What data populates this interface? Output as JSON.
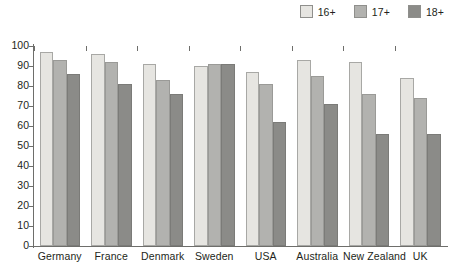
{
  "chart_data": {
    "type": "bar",
    "title": "",
    "subtitle": "",
    "xlabel": "",
    "ylabel": "",
    "ylim": [
      0,
      100
    ],
    "yticks": [
      0,
      10,
      20,
      30,
      40,
      50,
      60,
      70,
      80,
      90,
      100
    ],
    "grid": false,
    "legend_position": "top-right",
    "categories": [
      "Germany",
      "France",
      "Denmark",
      "Sweden",
      "USA",
      "Australia",
      "New Zealand",
      "UK"
    ],
    "series": [
      {
        "name": "16+",
        "color": "#e6e5e1",
        "values": [
          97,
          96,
          91,
          90,
          87,
          93,
          92,
          84
        ]
      },
      {
        "name": "17+",
        "color": "#b2b2af",
        "values": [
          93,
          92,
          83,
          91,
          81,
          85,
          76,
          74
        ]
      },
      {
        "name": "18+",
        "color": "#8b8b88",
        "values": [
          86,
          81,
          76,
          91,
          62,
          71,
          56,
          56
        ]
      }
    ]
  },
  "legend": {
    "items": [
      {
        "label": "16+",
        "color": "#e6e5e1"
      },
      {
        "label": "17+",
        "color": "#b2b2af"
      },
      {
        "label": "18+",
        "color": "#8b8b88"
      }
    ]
  },
  "axis": {
    "y_tick_labels": [
      "100",
      "90",
      "80",
      "70",
      "60",
      "50",
      "40",
      "30",
      "20",
      "10",
      "0"
    ],
    "x_tick_labels": [
      "Germany",
      "France",
      "Denmark",
      "Sweden",
      "USA",
      "Australia",
      "New Zealand",
      "UK"
    ]
  }
}
